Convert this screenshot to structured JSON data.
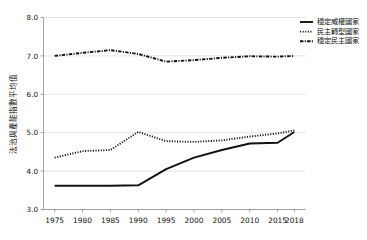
{
  "chart_data": {
    "type": "line",
    "title": "",
    "xlabel": "",
    "ylabel": "法治與產能指數平均值",
    "xlim": [
      1973,
      2020
    ],
    "ylim": [
      3.0,
      8.0
    ],
    "grid": true,
    "legend_position": "top-right",
    "x_tick_labels": [
      "1975",
      "1980",
      "1985",
      "1990",
      "1995",
      "2000",
      "2005",
      "2010",
      "2015",
      "2018"
    ],
    "x_ticks": [
      1975,
      1980,
      1985,
      1990,
      1995,
      2000,
      2005,
      2010,
      2015,
      2018
    ],
    "y_tick_labels": [
      "3.0",
      "4.0",
      "5.0",
      "6.0",
      "7.0",
      "8.0"
    ],
    "y_ticks": [
      3.0,
      4.0,
      5.0,
      6.0,
      7.0,
      8.0
    ],
    "x": [
      1975,
      1980,
      1985,
      1990,
      1995,
      2000,
      2005,
      2010,
      2015,
      2018
    ],
    "series": [
      {
        "name": "穩定威權國家",
        "style": "solid",
        "color": "#111111",
        "values": [
          3.62,
          3.62,
          3.62,
          3.63,
          4.05,
          4.35,
          4.55,
          4.72,
          4.74,
          5.02
        ]
      },
      {
        "name": "民主轉型國家",
        "style": "dotted",
        "color": "#111111",
        "values": [
          4.35,
          4.52,
          4.55,
          5.02,
          4.78,
          4.76,
          4.8,
          4.9,
          4.98,
          5.06
        ]
      },
      {
        "name": "穩定民主國家",
        "style": "dashdot",
        "color": "#111111",
        "values": [
          7.0,
          7.08,
          7.15,
          7.05,
          6.85,
          6.89,
          6.95,
          6.99,
          6.98,
          7.0
        ]
      }
    ]
  },
  "legend": {
    "entries": [
      {
        "label": "穩定威權國家",
        "style": "solid"
      },
      {
        "label": "民主轉型國家",
        "style": "dotted"
      },
      {
        "label": "穩定民主國家",
        "style": "dashdot"
      }
    ]
  }
}
